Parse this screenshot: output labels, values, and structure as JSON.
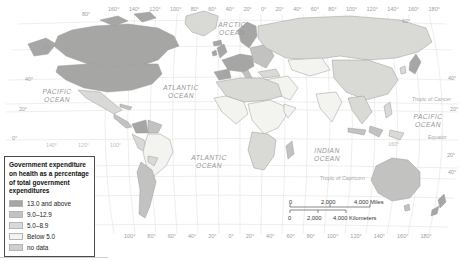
{
  "map": {
    "oceans": {
      "arctic": "ARCTIC OCEAN",
      "pacific_west": "PACIFIC OCEAN",
      "atlantic_north": "ATLANTIC OCEAN",
      "atlantic_south": "ATLANTIC OCEAN",
      "indian": "INDIAN OCEAN",
      "pacific_east": "PACIFIC OCEAN"
    },
    "reference_lines": {
      "cancer": "Tropic of Cancer",
      "equator": "Equator",
      "capricorn": "Tropic of Capricorn"
    },
    "grid": {
      "top": [
        "160°",
        "140°",
        "120°",
        "100°",
        "80°",
        "60°",
        "40°",
        "20°",
        "0°",
        "20°",
        "40°",
        "60°",
        "80°",
        "100°",
        "120°",
        "140°",
        "160°",
        "180°"
      ],
      "bottom": [
        "100°",
        "80°",
        "60°",
        "40°",
        "20°",
        "0°",
        "20°",
        "40°",
        "60°",
        "80°",
        "100°",
        "120°",
        "140°",
        "160°",
        "180°"
      ],
      "left": [
        "80°",
        "60°",
        "40°",
        "20°",
        "0°"
      ],
      "right": [
        "60°",
        "40°",
        "20°",
        "20°",
        "40°"
      ],
      "interior": [
        "140°",
        "120°",
        "100°",
        "160°"
      ]
    }
  },
  "legend": {
    "title": "Government expenditure on health as a percentage of total government expenditures",
    "items": [
      {
        "label": "13.0 and above",
        "color": "#a6a7a5"
      },
      {
        "label": "9.0–12.9",
        "color": "#c2c3c0"
      },
      {
        "label": "5.0–8.9",
        "color": "#d9dad6"
      },
      {
        "label": "Below 5.0",
        "color": "#f3f4f0"
      },
      {
        "label": "no data",
        "color": "#cfd0cd"
      }
    ]
  },
  "scale_bar": {
    "miles": {
      "start": "0",
      "mid": "2,000",
      "end": "4,000 Miles"
    },
    "kilometers": {
      "start": "0",
      "mid": "2,000",
      "end": "4,000 Kilometers"
    }
  },
  "regions": [
    {
      "name": "Canada",
      "cat": 0
    },
    {
      "name": "United States",
      "cat": 0
    },
    {
      "name": "Greenland",
      "cat": 2
    },
    {
      "name": "Mexico",
      "cat": 2
    },
    {
      "name": "Central America",
      "cat": 1
    },
    {
      "name": "Cuba",
      "cat": 1
    },
    {
      "name": "Colombia",
      "cat": 0
    },
    {
      "name": "Venezuela",
      "cat": 1
    },
    {
      "name": "Peru",
      "cat": 2
    },
    {
      "name": "Brazil",
      "cat": 3
    },
    {
      "name": "Bolivia",
      "cat": 2
    },
    {
      "name": "Argentina and Chile",
      "cat": 1
    },
    {
      "name": "Scandinavia",
      "cat": 0
    },
    {
      "name": "United Kingdom",
      "cat": 0
    },
    {
      "name": "Ireland",
      "cat": 0
    },
    {
      "name": "Western Europe",
      "cat": 0
    },
    {
      "name": "Iberia",
      "cat": 0
    },
    {
      "name": "Italy",
      "cat": 1
    },
    {
      "name": "Eastern Europe",
      "cat": 1
    },
    {
      "name": "Turkey",
      "cat": 2
    },
    {
      "name": "Russia",
      "cat": 2
    },
    {
      "name": "Central Asia",
      "cat": 3
    },
    {
      "name": "Middle East",
      "cat": 3
    },
    {
      "name": "China",
      "cat": 2
    },
    {
      "name": "India",
      "cat": 3
    },
    {
      "name": "Southeast Asia",
      "cat": 2
    },
    {
      "name": "Japan",
      "cat": 0
    },
    {
      "name": "Korea",
      "cat": 2
    },
    {
      "name": "Philippines",
      "cat": 2
    },
    {
      "name": "Indonesia",
      "cat": 1
    },
    {
      "name": "New Guinea",
      "cat": 2
    },
    {
      "name": "North Africa",
      "cat": 2
    },
    {
      "name": "West Africa",
      "cat": 3
    },
    {
      "name": "Central and East Africa",
      "cat": 3
    },
    {
      "name": "Horn of Africa",
      "cat": 3
    },
    {
      "name": "Southern Africa",
      "cat": 2
    },
    {
      "name": "Madagascar",
      "cat": 1
    },
    {
      "name": "Australia",
      "cat": 1
    },
    {
      "name": "New Zealand",
      "cat": 0
    },
    {
      "name": "Tasmania",
      "cat": 1
    },
    {
      "name": "Iceland",
      "cat": 0
    },
    {
      "name": "Arctic Islands",
      "cat": 0
    }
  ]
}
